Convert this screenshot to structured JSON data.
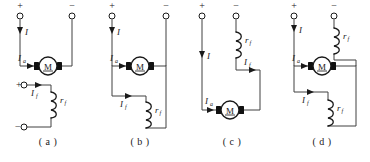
{
  "figure": {
    "panel_count": 4,
    "colors": {
      "wire": "#404040",
      "ink": "#1a1a1a",
      "background": "#ffffff",
      "brush": "#111111"
    }
  },
  "labels": {
    "plus": "+",
    "minus": "−",
    "motor": "M",
    "line_current": "I",
    "armature_current": "I",
    "armature_sub": "a",
    "field_current": "I",
    "field_sub": "f",
    "field_resistance": "r",
    "field_resistance_sub": "f"
  },
  "panels": [
    {
      "id": "a",
      "caption": "( a )",
      "excitation_type": "separately-excited",
      "terminals": [
        {
          "name": "supply-positive",
          "sign": "+"
        },
        {
          "name": "supply-negative",
          "sign": "−"
        },
        {
          "name": "field-positive",
          "sign": "+"
        },
        {
          "name": "field-negative",
          "sign": "−"
        }
      ],
      "currents": [
        "I",
        "Ia",
        "If"
      ],
      "components": [
        "armature-motor",
        "field-winding-rf"
      ]
    },
    {
      "id": "b",
      "caption": "( b )",
      "excitation_type": "shunt-excited",
      "terminals": [
        {
          "name": "supply-positive",
          "sign": "+"
        },
        {
          "name": "supply-negative",
          "sign": "−"
        }
      ],
      "currents": [
        "I",
        "Ia",
        "If"
      ],
      "components": [
        "armature-motor",
        "field-winding-rf"
      ]
    },
    {
      "id": "c",
      "caption": "( c )",
      "excitation_type": "series-excited",
      "terminals": [
        {
          "name": "supply-positive",
          "sign": "+"
        },
        {
          "name": "supply-negative",
          "sign": "−"
        }
      ],
      "currents": [
        "I",
        "Ia",
        "If"
      ],
      "components": [
        "armature-motor",
        "field-winding-rf"
      ]
    },
    {
      "id": "d",
      "caption": "( d )",
      "excitation_type": "compound-excited",
      "terminals": [
        {
          "name": "supply-positive",
          "sign": "+"
        },
        {
          "name": "supply-negative",
          "sign": "−"
        }
      ],
      "currents": [
        "I",
        "Ia",
        "If"
      ],
      "components": [
        "armature-motor",
        "series-field-winding-rf",
        "shunt-field-winding-rf"
      ]
    }
  ]
}
